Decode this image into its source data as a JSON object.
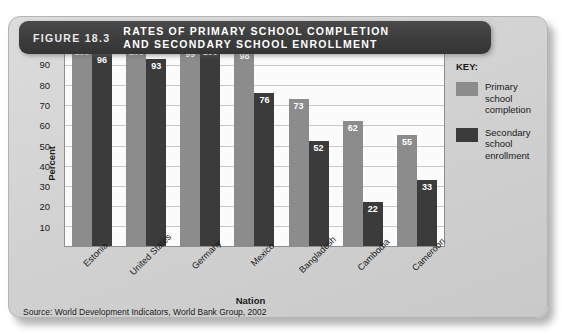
{
  "figure": {
    "number": "FIGURE 18.3",
    "title": "RATES OF PRIMARY SCHOOL COMPLETION\nAND SECONDARY SCHOOL ENROLLMENT",
    "source": "Source: World Development Indicators, World Bank Group, 2002"
  },
  "legend": {
    "title": "KEY:",
    "items": [
      {
        "label": "Primary school\ncompletion",
        "color": "#8c8c8c"
      },
      {
        "label": "Secondary\nschool\nenrollment",
        "color": "#3b3b3b"
      }
    ]
  },
  "chart_data": {
    "type": "bar",
    "title": "RATES OF PRIMARY SCHOOL COMPLETION AND SECONDARY SCHOOL ENROLLMENT",
    "xlabel": "Nation",
    "ylabel": "Percent",
    "ylim": [
      0,
      100
    ],
    "yticks": [
      100,
      90,
      80,
      70,
      60,
      50,
      40,
      30,
      20,
      10
    ],
    "grid": true,
    "legend_position": "right",
    "categories": [
      "Estonia",
      "United States",
      "Germany",
      "Mexico",
      "Bangladesh",
      "Cambodia",
      "Cameroon"
    ],
    "series": [
      {
        "name": "Primary school completion",
        "color": "#8c8c8c",
        "values": [
          100,
          100,
          99,
          98,
          73,
          62,
          55
        ]
      },
      {
        "name": "Secondary school enrollment",
        "color": "#3b3b3b",
        "values": [
          96,
          93,
          100,
          76,
          52,
          22,
          33
        ]
      }
    ]
  }
}
